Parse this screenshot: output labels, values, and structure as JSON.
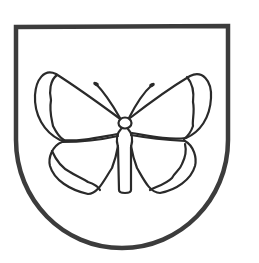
{
  "image": {
    "description": "Coat of arms: a shield outline with a butterfly outline inside",
    "background": "#ffffff",
    "shield": {
      "stroke_color": "#3c3c3c",
      "stroke_width": 4.5,
      "fill": "#ffffff"
    },
    "butterfly": {
      "stroke_color": "#2a2a2a",
      "stroke_width": 2.2
    },
    "alt_text": "Shield with butterfly"
  }
}
